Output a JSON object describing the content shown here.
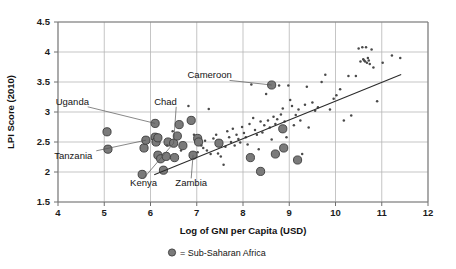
{
  "chart_data": {
    "type": "scatter",
    "title": "",
    "xlabel": "Log of GNI per Capita (USD)",
    "ylabel": "LPI Score (2010)",
    "xlim": [
      4,
      12
    ],
    "ylim": [
      1.5,
      4.5
    ],
    "xticks": [
      "4",
      "5",
      "6",
      "7",
      "8",
      "9",
      "10",
      "11",
      "12"
    ],
    "yticks": [
      "1.5",
      "2",
      "2.5",
      "3",
      "3.5",
      "4",
      "4.5"
    ],
    "xtick_values": [
      4,
      5,
      6,
      7,
      8,
      9,
      10,
      11,
      12
    ],
    "ytick_values": [
      1.5,
      2,
      2.5,
      3,
      3.5,
      4,
      4.5
    ],
    "grid": true,
    "legend_position": "below-axis",
    "legend": [
      {
        "marker": "ssa-dot",
        "label": "= Sub-Saharan Africa",
        "color": "#7a7a7a"
      }
    ],
    "trendline": {
      "x0": 6.08,
      "y0": 1.955,
      "x1": 11.42,
      "y1": 3.625,
      "color": "#2b2b2b"
    },
    "series": [
      {
        "name": "Sub-Saharan Africa",
        "marker": "large-filled-circle",
        "color": "#7a7a7a",
        "points": [
          [
            5.06,
            2.67
          ],
          [
            5.08,
            2.38
          ],
          [
            5.82,
            1.96
          ],
          [
            5.86,
            2.4
          ],
          [
            5.9,
            2.53
          ],
          [
            6.1,
            2.81
          ],
          [
            6.1,
            2.58
          ],
          [
            6.12,
            2.5
          ],
          [
            6.16,
            2.57
          ],
          [
            6.16,
            2.28
          ],
          [
            6.22,
            2.22
          ],
          [
            6.28,
            2.03
          ],
          [
            6.34,
            2.26
          ],
          [
            6.38,
            2.5
          ],
          [
            6.5,
            2.48
          ],
          [
            6.52,
            2.24
          ],
          [
            6.58,
            2.6
          ],
          [
            6.62,
            2.79
          ],
          [
            6.7,
            2.44
          ],
          [
            6.88,
            2.86
          ],
          [
            6.92,
            2.28
          ],
          [
            7.02,
            2.56
          ],
          [
            7.04,
            2.5
          ],
          [
            7.48,
            2.48
          ],
          [
            8.16,
            2.24
          ],
          [
            8.38,
            2.01
          ],
          [
            8.62,
            3.45
          ],
          [
            8.7,
            2.3
          ],
          [
            8.88,
            2.4
          ],
          [
            8.86,
            2.72
          ],
          [
            9.18,
            2.2
          ]
        ]
      },
      {
        "name": "Other countries",
        "marker": "small-dot",
        "color": "#4a4a4a",
        "points": [
          [
            6.36,
            2.44
          ],
          [
            6.48,
            2.68
          ],
          [
            6.66,
            2.36
          ],
          [
            6.82,
            3.1
          ],
          [
            6.94,
            2.62
          ],
          [
            7.02,
            2.33
          ],
          [
            7.1,
            2.44
          ],
          [
            7.14,
            2.4
          ],
          [
            7.18,
            2.52
          ],
          [
            7.22,
            2.36
          ],
          [
            7.26,
            3.05
          ],
          [
            7.3,
            2.3
          ],
          [
            7.36,
            2.56
          ],
          [
            7.42,
            2.62
          ],
          [
            7.46,
            2.31
          ],
          [
            7.52,
            2.26
          ],
          [
            7.58,
            2.12
          ],
          [
            7.62,
            2.42
          ],
          [
            7.66,
            2.68
          ],
          [
            7.7,
            2.58
          ],
          [
            7.74,
            2.5
          ],
          [
            7.78,
            2.72
          ],
          [
            7.82,
            2.44
          ],
          [
            7.86,
            2.62
          ],
          [
            7.9,
            2.55
          ],
          [
            7.94,
            2.49
          ],
          [
            7.98,
            2.75
          ],
          [
            8.02,
            2.65
          ],
          [
            8.06,
            2.58
          ],
          [
            8.1,
            2.46
          ],
          [
            8.14,
            2.8
          ],
          [
            8.18,
            3.46
          ],
          [
            8.22,
            2.9
          ],
          [
            8.26,
            2.7
          ],
          [
            8.3,
            2.62
          ],
          [
            8.34,
            2.38
          ],
          [
            8.38,
            2.84
          ],
          [
            8.42,
            2.66
          ],
          [
            8.46,
            2.78
          ],
          [
            8.5,
            3.3
          ],
          [
            8.54,
            2.86
          ],
          [
            8.58,
            2.74
          ],
          [
            8.62,
            2.54
          ],
          [
            8.66,
            2.92
          ],
          [
            8.7,
            2.8
          ],
          [
            8.74,
            2.88
          ],
          [
            8.78,
            3.44
          ],
          [
            8.82,
            2.96
          ],
          [
            8.86,
            3.06
          ],
          [
            8.9,
            2.84
          ],
          [
            8.94,
            2.58
          ],
          [
            8.98,
            3.44
          ],
          [
            9.02,
            3.2
          ],
          [
            9.06,
            3.1
          ],
          [
            9.1,
            2.78
          ],
          [
            9.14,
            2.95
          ],
          [
            9.2,
            3.04
          ],
          [
            9.24,
            2.86
          ],
          [
            9.28,
            2.3
          ],
          [
            9.34,
            3.12
          ],
          [
            9.38,
            3.42
          ],
          [
            9.42,
            2.74
          ],
          [
            9.5,
            3.16
          ],
          [
            9.56,
            3.02
          ],
          [
            9.62,
            3.08
          ],
          [
            9.7,
            3.5
          ],
          [
            9.78,
            3.62
          ],
          [
            9.88,
            3.04
          ],
          [
            9.96,
            3.22
          ],
          [
            10.02,
            3.28
          ],
          [
            10.1,
            3.38
          ],
          [
            10.18,
            2.86
          ],
          [
            10.28,
            3.6
          ],
          [
            10.34,
            2.94
          ],
          [
            10.44,
            3.6
          ],
          [
            10.5,
            4.06
          ],
          [
            10.54,
            3.84
          ],
          [
            10.58,
            4.08
          ],
          [
            10.6,
            3.88
          ],
          [
            10.62,
            3.86
          ],
          [
            10.64,
            3.84
          ],
          [
            10.66,
            4.08
          ],
          [
            10.68,
            3.82
          ],
          [
            10.7,
            3.9
          ],
          [
            10.72,
            3.86
          ],
          [
            10.74,
            3.8
          ],
          [
            10.78,
            4.04
          ],
          [
            10.82,
            3.74
          ],
          [
            10.9,
            3.18
          ],
          [
            11.02,
            3.82
          ],
          [
            11.22,
            3.94
          ],
          [
            11.4,
            3.9
          ]
        ]
      }
    ],
    "annotations": [
      {
        "label": "Uganda",
        "text_x": 3.95,
        "text_y": 3.12,
        "anchor": "start",
        "target_x": 6.1,
        "target_y": 2.81
      },
      {
        "label": "Chad",
        "text_x": 6.08,
        "text_y": 3.12,
        "anchor": "start",
        "target_x": 6.5,
        "target_y": 2.48
      },
      {
        "label": "Cameroon",
        "text_x": 6.8,
        "text_y": 3.56,
        "anchor": "start",
        "target_x": 8.62,
        "target_y": 3.45
      },
      {
        "label": "Tanzania",
        "text_x": 3.92,
        "text_y": 2.22,
        "anchor": "start",
        "target_x": 5.9,
        "target_y": 2.53
      },
      {
        "label": "Kenya",
        "text_x": 5.85,
        "text_y": 1.76,
        "anchor": "middle",
        "target_x": 6.5,
        "target_y": 2.48
      },
      {
        "label": "Zambia",
        "text_x": 6.88,
        "text_y": 1.76,
        "anchor": "middle",
        "target_x": 6.92,
        "target_y": 2.28
      }
    ]
  }
}
